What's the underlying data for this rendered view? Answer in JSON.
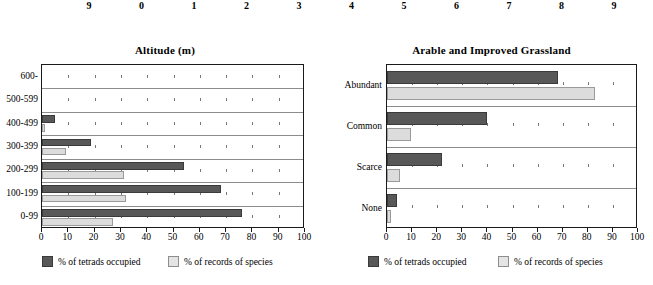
{
  "top_axis_strip": {
    "name": "cut-off-axis-labels",
    "labels": [
      "9",
      "0",
      "1",
      "2",
      "3",
      "4",
      "5",
      "6",
      "7",
      "8",
      "9",
      "0"
    ]
  },
  "legend": {
    "series_dark_label": "% of tetrads occupied",
    "series_light_label": "% of records of species",
    "dark_color": "#585858",
    "light_color": "#e4e4e4"
  },
  "chart_data": [
    {
      "type": "bar",
      "orientation": "horizontal",
      "title": "Altitude (m)",
      "xlabel": "",
      "ylabel": "",
      "xlim": [
        0,
        100
      ],
      "xticks": [
        0,
        10,
        20,
        30,
        40,
        50,
        60,
        70,
        80,
        90,
        100
      ],
      "xtick_labels": [
        "0",
        "10",
        "20",
        "30",
        "40",
        "50",
        "60",
        "70",
        "80",
        "90",
        "100"
      ],
      "grid": true,
      "legend_position": "bottom",
      "categories": [
        "600-",
        "500-599",
        "400-499",
        "300-399",
        "200-299",
        "100-199",
        "0-99"
      ],
      "series": [
        {
          "name": "% of tetrads occupied",
          "color": "#585858",
          "values": [
            0,
            0,
            5,
            18.5,
            54,
            68,
            76
          ]
        },
        {
          "name": "% of records of species",
          "color": "#e4e4e4",
          "values": [
            0,
            0,
            1,
            9,
            31,
            32,
            27
          ]
        }
      ]
    },
    {
      "type": "bar",
      "orientation": "horizontal",
      "title": "Arable and Improved Grassland",
      "xlabel": "",
      "ylabel": "",
      "xlim": [
        0,
        100
      ],
      "xticks": [
        0,
        10,
        20,
        30,
        40,
        50,
        60,
        70,
        80,
        90,
        100
      ],
      "xtick_labels": [
        "0",
        "10",
        "20",
        "30",
        "40",
        "50",
        "60",
        "70",
        "80",
        "90",
        "100"
      ],
      "grid": true,
      "legend_position": "bottom",
      "categories": [
        "Abundant",
        "Common",
        "Scarce",
        "None"
      ],
      "series": [
        {
          "name": "% of tetrads occupied",
          "color": "#585858",
          "values": [
            68,
            40,
            22,
            4
          ]
        },
        {
          "name": "% of records of species",
          "color": "#e4e4e4",
          "values": [
            83,
            9.5,
            5,
            1.5
          ]
        }
      ]
    }
  ]
}
